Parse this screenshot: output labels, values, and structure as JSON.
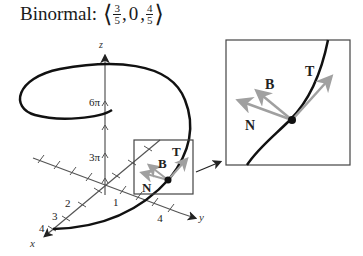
{
  "title": {
    "label": "Binormal:",
    "open": "⟨",
    "close": "⟩",
    "components": [
      {
        "type": "fraction",
        "num": "3",
        "den": "5"
      },
      {
        "type": "text",
        "value": "0"
      },
      {
        "type": "fraction",
        "num": "4",
        "den": "5"
      }
    ],
    "sep": ","
  },
  "axes": {
    "x_label": "x",
    "y_label": "y",
    "z_label": "z",
    "z_ticks": [
      "6π",
      "3π"
    ],
    "x_ticks": [
      "1",
      "2",
      "3",
      "4"
    ],
    "y_ticks": [
      "4"
    ]
  },
  "vectors": {
    "T": "T",
    "N": "N",
    "B": "B"
  },
  "colors": {
    "curve": "#111111",
    "axis": "#555555",
    "vector": "#a0a0a0",
    "box": "#444444"
  }
}
